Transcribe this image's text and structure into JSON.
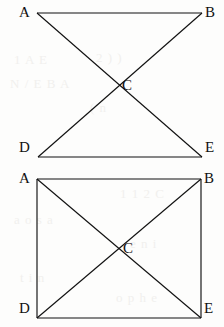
{
  "page": {
    "width": 224,
    "height": 327,
    "background_color": "#fdfdfc",
    "ink_color": "#111111",
    "ghost_text_color": "#f1f0ee"
  },
  "ghost_artifacts": [
    {
      "text": "1 A E",
      "x": 14,
      "y": 52
    },
    {
      "text": "2 ) )",
      "x": 96,
      "y": 50
    },
    {
      "text": "N / E B A",
      "x": 10,
      "y": 76
    },
    {
      "text": "( n",
      "x": 90,
      "y": 100
    },
    {
      "text": "1 1 2 C",
      "x": 120,
      "y": 186
    },
    {
      "text": "a o s a",
      "x": 14,
      "y": 212
    },
    {
      "text": "e n i",
      "x": 130,
      "y": 236
    },
    {
      "text": "t i n",
      "x": 20,
      "y": 270
    },
    {
      "text": "o p h e",
      "x": 116,
      "y": 290
    }
  ],
  "figures": [
    {
      "id": "bowtie",
      "name": "Bowtie figure ABDE with intersection C",
      "shape_type": "bowtie",
      "caption": "",
      "viewbox": {
        "width": 224,
        "height": 166
      },
      "vertices": [
        {
          "id": "A",
          "label": "A",
          "x": 37,
          "y": 13,
          "label_x": 19,
          "label_y": 5
        },
        {
          "id": "B",
          "label": "B",
          "x": 202,
          "y": 13,
          "label_x": 205,
          "label_y": 5
        },
        {
          "id": "C",
          "label": "C",
          "x": 119,
          "y": 86,
          "label_x": 122,
          "label_y": 78
        },
        {
          "id": "D",
          "label": "D",
          "x": 38,
          "y": 157,
          "label_x": 19,
          "label_y": 140
        },
        {
          "id": "E",
          "label": "E",
          "x": 202,
          "y": 157,
          "label_x": 205,
          "label_y": 140
        }
      ],
      "edges": [
        {
          "id": "AB",
          "from": "A",
          "to": "B",
          "kind": "side"
        },
        {
          "id": "DE",
          "from": "D",
          "to": "E",
          "kind": "side"
        },
        {
          "id": "AE",
          "from": "A",
          "to": "E",
          "kind": "diagonal"
        },
        {
          "id": "BD",
          "from": "B",
          "to": "D",
          "kind": "diagonal"
        }
      ]
    },
    {
      "id": "rectangle",
      "name": "Rectangle ABED with diagonals meeting at C",
      "shape_type": "rectangle-with-diagonals",
      "caption": "",
      "viewbox": {
        "width": 224,
        "height": 161
      },
      "vertices": [
        {
          "id": "A",
          "label": "A",
          "x": 37,
          "y": 13,
          "label_x": 19,
          "label_y": 171
        },
        {
          "id": "B",
          "label": "B",
          "x": 201,
          "y": 13,
          "label_x": 204,
          "label_y": 171
        },
        {
          "id": "C",
          "label": "C",
          "x": 119,
          "y": 83,
          "label_x": 123,
          "label_y": 241
        },
        {
          "id": "D",
          "label": "D",
          "x": 37,
          "y": 152,
          "label_x": 19,
          "label_y": 301
        },
        {
          "id": "E",
          "label": "E",
          "x": 201,
          "y": 152,
          "label_x": 204,
          "label_y": 301
        }
      ],
      "edges": [
        {
          "id": "AB",
          "from": "A",
          "to": "B",
          "kind": "side"
        },
        {
          "id": "BE",
          "from": "B",
          "to": "E",
          "kind": "side"
        },
        {
          "id": "ED",
          "from": "E",
          "to": "D",
          "kind": "side"
        },
        {
          "id": "DA",
          "from": "D",
          "to": "A",
          "kind": "side"
        },
        {
          "id": "AE",
          "from": "A",
          "to": "E",
          "kind": "diagonal"
        },
        {
          "id": "BD",
          "from": "B",
          "to": "D",
          "kind": "diagonal"
        }
      ]
    }
  ]
}
